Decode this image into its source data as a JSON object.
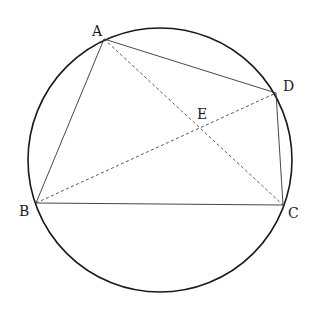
{
  "diagram": {
    "circle": {
      "cx": 160,
      "cy": 160,
      "r": 132
    },
    "points": {
      "A": {
        "x": 104,
        "y": 39,
        "label": "A",
        "label_x": 92,
        "label_y": 36
      },
      "B": {
        "x": 36,
        "y": 203,
        "label": "B",
        "label_x": 19,
        "label_y": 216
      },
      "C": {
        "x": 283,
        "y": 205,
        "label": "C",
        "label_x": 288,
        "label_y": 218
      },
      "D": {
        "x": 276,
        "y": 93,
        "label": "D",
        "label_x": 283,
        "label_y": 91
      },
      "E": {
        "x": 201,
        "y": 124,
        "label": "E",
        "label_x": 197,
        "label_y": 119
      }
    },
    "solid_segments": [
      {
        "from": "A",
        "to": "B"
      },
      {
        "from": "B",
        "to": "C"
      },
      {
        "from": "C",
        "to": "D"
      },
      {
        "from": "D",
        "to": "A"
      }
    ],
    "dashed_segments": [
      {
        "from": "A",
        "to": "C"
      },
      {
        "from": "B",
        "to": "D"
      }
    ]
  }
}
